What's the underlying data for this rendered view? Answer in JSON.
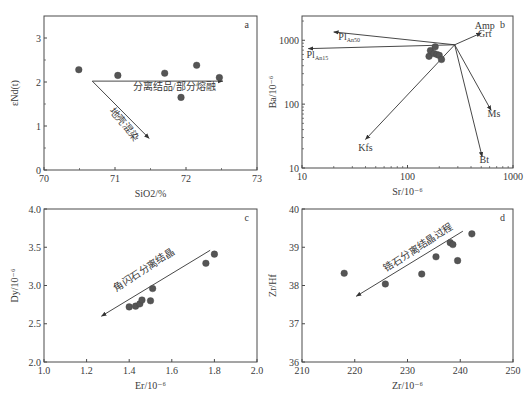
{
  "figure": {
    "caption": ""
  },
  "colors": {
    "axis": "#4a4a4a",
    "point": "#555555",
    "text": "#3a3a3a",
    "arrow": "#333333"
  },
  "chart_data": [
    {
      "panel": "a",
      "type": "scatter",
      "title": "",
      "xlabel": "SiO2/%",
      "ylabel": "εNd(t)",
      "xlim": [
        70,
        73
      ],
      "ylim": [
        0,
        3.5
      ],
      "x_ticks": [
        70,
        71,
        72,
        73
      ],
      "y_ticks": [
        0,
        1,
        2,
        3
      ],
      "x_scale": "linear",
      "y_scale": "linear",
      "grid": false,
      "frame": {
        "x0": 44,
        "x1": 257,
        "y0": 16,
        "y1": 170
      },
      "points": [
        {
          "x": 70.49,
          "y": 2.28
        },
        {
          "x": 71.04,
          "y": 2.15
        },
        {
          "x": 71.7,
          "y": 2.2
        },
        {
          "x": 71.93,
          "y": 1.65
        },
        {
          "x": 72.15,
          "y": 2.38
        },
        {
          "x": 72.47,
          "y": 2.1
        }
      ],
      "annotations": [
        {
          "type": "arrow",
          "from": [
            70.68,
            2.02
          ],
          "to": [
            72.52,
            2.02
          ],
          "label": "分离结品/部分熔融",
          "label_pos": [
            71.25,
            1.82
          ],
          "rotate": 0
        },
        {
          "type": "arrow",
          "from": [
            70.68,
            2.02
          ],
          "to": [
            71.48,
            0.72
          ],
          "label": "地壳混染",
          "label_pos": [
            70.92,
            1.35
          ],
          "rotate": 52
        }
      ]
    },
    {
      "panel": "b",
      "type": "scatter",
      "title": "",
      "xlabel": "Sr/10⁻⁶",
      "ylabel": "Ba/10⁻⁶",
      "xlim": [
        10,
        1000
      ],
      "ylim": [
        10,
        2400
      ],
      "x_ticks": [
        10,
        100,
        1000
      ],
      "y_ticks": [
        10,
        100,
        1000
      ],
      "x_scale": "log",
      "y_scale": "log",
      "grid": false,
      "frame": {
        "x0": 302,
        "x1": 513,
        "y0": 16,
        "y1": 168
      },
      "points": [
        {
          "x": 160,
          "y": 560
        },
        {
          "x": 165,
          "y": 690
        },
        {
          "x": 178,
          "y": 620
        },
        {
          "x": 183,
          "y": 790
        },
        {
          "x": 190,
          "y": 600
        },
        {
          "x": 200,
          "y": 580
        },
        {
          "x": 210,
          "y": 500
        }
      ],
      "origin": [
        280,
        850
      ],
      "vectors": [
        {
          "name": "Amp Grt",
          "to": [
            500,
            1300
          ],
          "label": "Amp",
          "label2": "Grt",
          "label_pos": [
            540,
            1500
          ],
          "label2_pos": [
            540,
            1130
          ]
        },
        {
          "name": "Pl An50",
          "to": [
            20,
            1350
          ],
          "label": "Pl",
          "sub": "An50",
          "label_pos": [
            28,
            1000
          ]
        },
        {
          "name": "Pl An15",
          "to": [
            11.5,
            740
          ],
          "label": "Pl",
          "sub": "An15",
          "label_pos": [
            14,
            530
          ]
        },
        {
          "name": "Kfs",
          "to": [
            40,
            28
          ],
          "label": "Kfs",
          "label_pos": [
            40,
            18.5
          ]
        },
        {
          "name": "Ms",
          "to": [
            620,
            80
          ],
          "label": "Ms",
          "label_pos": [
            660,
            63
          ]
        },
        {
          "name": "Bt",
          "to": [
            510,
            15
          ],
          "label": "Bt",
          "label_pos": [
            535,
            11.8
          ]
        }
      ]
    },
    {
      "panel": "c",
      "type": "scatter",
      "title": "",
      "xlabel": "Er/10⁻⁶",
      "ylabel": "Dy/10⁻⁶",
      "xlim": [
        1.0,
        2.0
      ],
      "ylim": [
        2.0,
        4.0
      ],
      "x_ticks": [
        1.0,
        1.2,
        1.4,
        1.6,
        1.8,
        2.0
      ],
      "y_ticks": [
        2.0,
        2.5,
        3.0,
        3.5,
        4.0
      ],
      "x_scale": "linear",
      "y_scale": "linear",
      "grid": false,
      "frame": {
        "x0": 44,
        "x1": 257,
        "y0": 209,
        "y1": 362
      },
      "points": [
        {
          "x": 1.4,
          "y": 2.72
        },
        {
          "x": 1.43,
          "y": 2.73
        },
        {
          "x": 1.45,
          "y": 2.76
        },
        {
          "x": 1.46,
          "y": 2.81
        },
        {
          "x": 1.5,
          "y": 2.8
        },
        {
          "x": 1.51,
          "y": 2.96
        },
        {
          "x": 1.76,
          "y": 3.29
        },
        {
          "x": 1.8,
          "y": 3.41
        }
      ],
      "annotations": [
        {
          "type": "arrow",
          "from": [
            1.78,
            3.46
          ],
          "to": [
            1.27,
            2.6
          ],
          "label": "角闪石分离结晶",
          "label_pos": [
            1.34,
            2.92
          ],
          "rotate": -33
        }
      ]
    },
    {
      "panel": "d",
      "type": "scatter",
      "title": "",
      "xlabel": "Zr/10⁻⁶",
      "ylabel": "Zr/Hf",
      "xlim": [
        210,
        250
      ],
      "ylim": [
        36,
        40
      ],
      "x_ticks": [
        210,
        220,
        230,
        240,
        250
      ],
      "y_ticks": [
        36,
        37,
        38,
        39,
        40
      ],
      "x_scale": "linear",
      "y_scale": "linear",
      "grid": false,
      "frame": {
        "x0": 302,
        "x1": 513,
        "y0": 209,
        "y1": 362
      },
      "points": [
        {
          "x": 218.0,
          "y": 38.32
        },
        {
          "x": 225.8,
          "y": 38.04
        },
        {
          "x": 232.7,
          "y": 38.3
        },
        {
          "x": 235.4,
          "y": 38.75
        },
        {
          "x": 238.1,
          "y": 39.12
        },
        {
          "x": 238.6,
          "y": 39.07
        },
        {
          "x": 239.5,
          "y": 38.65
        },
        {
          "x": 242.2,
          "y": 39.35
        }
      ],
      "annotations": [
        {
          "type": "arrow",
          "from": [
            240.5,
            39.42
          ],
          "to": [
            220.3,
            37.72
          ],
          "label": "锆石分离结晶过程",
          "label_pos": [
            226.0,
            38.35
          ],
          "rotate": -33
        }
      ]
    }
  ]
}
